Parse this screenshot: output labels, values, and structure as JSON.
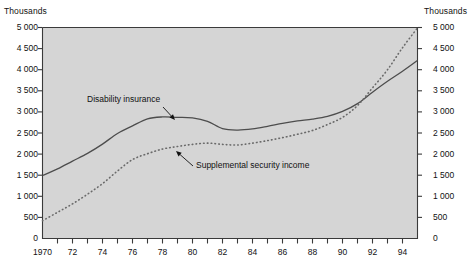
{
  "chart_data": {
    "type": "line",
    "title": "",
    "subtitle": "",
    "xlabel": "",
    "ylabel": "Thousands",
    "ylabel_right": "Thousands",
    "xlim": [
      1970,
      1995
    ],
    "ylim": [
      0,
      5000
    ],
    "grid": false,
    "legend_position": "inline-annotations",
    "background": "#d5d5d5",
    "y_ticks": [
      0,
      500,
      1000,
      1500,
      2000,
      2500,
      3000,
      3500,
      4000,
      4500,
      5000
    ],
    "y_tick_labels": [
      "0",
      "500",
      "1 000",
      "1 500",
      "2 000",
      "2 500",
      "3 000",
      "3 500",
      "4 000",
      "4 500",
      "5 000"
    ],
    "x_ticks": [
      1970,
      1971,
      1972,
      1973,
      1974,
      1975,
      1976,
      1977,
      1978,
      1979,
      1980,
      1981,
      1982,
      1983,
      1984,
      1985,
      1986,
      1987,
      1988,
      1989,
      1990,
      1991,
      1992,
      1993,
      1994,
      1995
    ],
    "x_tick_labels": [
      {
        "value": 1970,
        "label": "1970"
      },
      {
        "value": 1972,
        "label": "72"
      },
      {
        "value": 1974,
        "label": "74"
      },
      {
        "value": 1976,
        "label": "76"
      },
      {
        "value": 1978,
        "label": "78"
      },
      {
        "value": 1980,
        "label": "80"
      },
      {
        "value": 1982,
        "label": "82"
      },
      {
        "value": 1984,
        "label": "84"
      },
      {
        "value": 1986,
        "label": "86"
      },
      {
        "value": 1988,
        "label": "88"
      },
      {
        "value": 1990,
        "label": "90"
      },
      {
        "value": 1992,
        "label": "92"
      },
      {
        "value": 1994,
        "label": "94"
      }
    ],
    "x": [
      1970,
      1971,
      1972,
      1973,
      1974,
      1975,
      1976,
      1977,
      1978,
      1979,
      1980,
      1981,
      1982,
      1983,
      1984,
      1985,
      1986,
      1987,
      1988,
      1989,
      1990,
      1991,
      1992,
      1993,
      1994,
      1995
    ],
    "series": [
      {
        "name": "Disability insurance",
        "style": "solid",
        "color": "#4d4d4d",
        "values": [
          1493,
          1648,
          1833,
          2017,
          2237,
          2489,
          2670,
          2837,
          2880,
          2871,
          2859,
          2777,
          2603,
          2569,
          2596,
          2657,
          2728,
          2785,
          2830,
          2895,
          3011,
          3195,
          3468,
          3726,
          3963,
          4220
        ]
      },
      {
        "name": "Supplemental security income",
        "style": "dotted",
        "color": "#6a6a6a",
        "values": [
          420,
          620,
          820,
          1050,
          1300,
          1600,
          1870,
          2010,
          2120,
          2180,
          2230,
          2260,
          2230,
          2215,
          2260,
          2320,
          2390,
          2470,
          2560,
          2700,
          2870,
          3150,
          3570,
          4000,
          4520,
          4990
        ]
      }
    ],
    "annotations": [
      {
        "text": "Disability insurance",
        "label_x": 87,
        "label_y": 102,
        "arrow_from_x": 163,
        "arrow_from_y": 107,
        "arrow_to_x": 175,
        "arrow_to_y": 120
      },
      {
        "text": "Supplemental security income",
        "label_x": 196,
        "label_y": 168,
        "arrow_from_x": 193,
        "arrow_from_y": 166,
        "arrow_to_x": 176,
        "arrow_to_y": 151
      }
    ]
  }
}
